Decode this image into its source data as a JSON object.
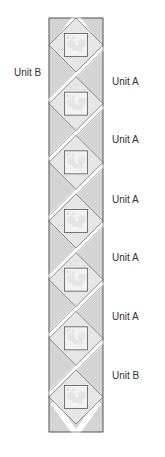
{
  "diagram": {
    "units": [
      {
        "label": "Unit B",
        "side": "left"
      },
      {
        "label": "Unit A",
        "side": "right"
      },
      {
        "label": "Unit A",
        "side": "right"
      },
      {
        "label": "Unit A",
        "side": "right"
      },
      {
        "label": "Unit A",
        "side": "right"
      },
      {
        "label": "Unit A",
        "side": "right"
      },
      {
        "label": "Unit B",
        "side": "right"
      }
    ],
    "block_count": 7,
    "colors": {
      "triangle_fill": "#d4d4d4",
      "setting_fill": "#e6e6e6",
      "center_fill": "#f2f2f2",
      "center_mottle": "#dcdcdc",
      "outline": "#555555",
      "sashing": "#ffffff"
    }
  }
}
